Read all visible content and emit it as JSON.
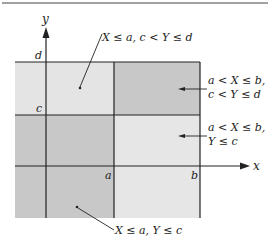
{
  "diagram": {
    "type": "region-partition",
    "colors": {
      "light": "#e4e4e4",
      "dark": "#c8c8c8",
      "line": "#222222",
      "background": "#ffffff"
    },
    "axes": {
      "x_label": "x",
      "y_label": "y"
    },
    "ticks": {
      "a": "a",
      "b": "b",
      "c": "c",
      "d": "d"
    },
    "regions": [
      {
        "id": "top-left",
        "shade": "light",
        "label_line1": "X ≤ a, c < Y ≤ d"
      },
      {
        "id": "top-right",
        "shade": "dark",
        "label_line1": "a < X ≤ b,",
        "label_line2": "c < Y ≤ d"
      },
      {
        "id": "middle-right",
        "shade": "light",
        "label_line1": "a < X ≤ b,",
        "label_line2": "Y ≤ c"
      },
      {
        "id": "bottom-left",
        "shade": "dark",
        "label_line1": "X ≤ a, Y ≤ c"
      }
    ]
  }
}
